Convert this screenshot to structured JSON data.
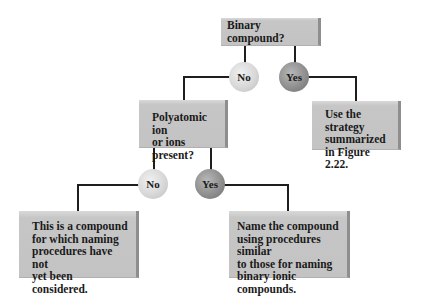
{
  "flowchart": {
    "root": {
      "label": "Binary compound?"
    },
    "root_no": {
      "label": "No"
    },
    "root_yes": {
      "label": "Yes"
    },
    "yes_result": {
      "label": "Use the strategy\nsummarized\nin Figure 2.22."
    },
    "polyatomic": {
      "label": "Polyatomic ion\nor ions present?"
    },
    "poly_no": {
      "label": "No"
    },
    "poly_yes": {
      "label": "Yes"
    },
    "poly_no_result": {
      "label": "This is a compound\nfor which naming\nprocedures have not\nyet been considered."
    },
    "poly_yes_result": {
      "label": "Name the compound\nusing procedures similar\nto those for naming\nbinary ionic compounds."
    }
  },
  "colors": {
    "box": "#c6c6c6",
    "no_circle": "#d8d8d8",
    "yes_circle": "#8f8f8f",
    "connector": "#1e1e1e"
  }
}
